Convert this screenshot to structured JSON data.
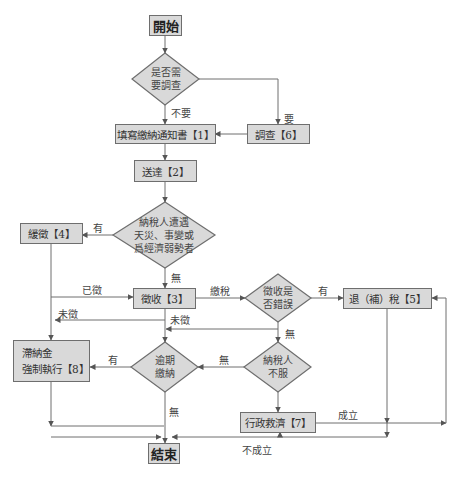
{
  "diagram": {
    "start": "開始",
    "end": "結束",
    "decisions": {
      "need_investigation": [
        "是否需",
        "要調查"
      ],
      "disaster_or_weak": [
        "納稅人遭遇",
        "天災、事變或",
        "爲經濟弱勢者"
      ],
      "collection_error": [
        "徵收是",
        "否錯誤"
      ],
      "taxpayer_disagrees": [
        "納稅人",
        "不服"
      ],
      "overdue_payment": [
        "逾期",
        "繳納"
      ]
    },
    "processes": {
      "p1": "填寫繳納通知書【1】",
      "p2": "送達【2】",
      "p3": "徵收【3】",
      "p4": "緩徵【4】",
      "p5": "退（補）稅【5】",
      "p6": "調查【6】",
      "p7": "行政救濟【7】",
      "p8": [
        "滯納金",
        "強制執行【8】"
      ]
    },
    "edge_labels": {
      "no_need": "不要",
      "need": "要",
      "has_disaster": "有",
      "no_disaster": "無",
      "paid": "已徵",
      "unpaid_left": "未徵",
      "unpaid_center": "未徵",
      "pay_tax": "繳稅",
      "has_error": "有",
      "no_error": "無",
      "no_disagree": "無",
      "overdue_yes": "有",
      "overdue_no": "無",
      "established": "成立",
      "not_established": "不成立"
    },
    "colors": {
      "box_fill": "#d9d9d9",
      "border": "#6e6e6e",
      "line": "#6e6e6e"
    }
  }
}
